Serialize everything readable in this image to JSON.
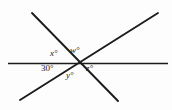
{
  "figure": {
    "kind": "geometry-diagram",
    "background_color": "#fdfdfd",
    "line_color": "#1b1b1b",
    "text_color": "#1b1b1b",
    "width": 172,
    "height": 110
  },
  "lines": [
    {
      "id": "horizontal-line",
      "name": "horizontal-line",
      "x1": 8,
      "y1": 63.5,
      "x2": 168,
      "y2": 63.5,
      "stroke_width": 1.6
    },
    {
      "id": "line-nw-se",
      "name": "line-northwest-southeast",
      "x1": 32,
      "y1": 13,
      "x2": 118,
      "y2": 101,
      "stroke_width": 1.9
    },
    {
      "id": "line-sw-ne",
      "name": "line-southwest-northeast",
      "x1": 20,
      "y1": 100,
      "x2": 158,
      "y2": 13,
      "stroke_width": 1.9
    }
  ],
  "intersection": {
    "x": 75,
    "y": 64
  },
  "labels": [
    {
      "id": "x",
      "text": "x°",
      "x": 50,
      "y": 49,
      "italic": true
    },
    {
      "id": "w",
      "text": "w°",
      "x": 70,
      "y": 46,
      "italic": true
    },
    {
      "id": "a30",
      "text": "30°",
      "x": 41,
      "y": 64,
      "italic": false
    },
    {
      "id": "y",
      "text": "y°",
      "x": 66,
      "y": 71,
      "italic": true
    },
    {
      "id": "z",
      "text": "z°",
      "x": 86,
      "y": 64,
      "italic": true
    }
  ],
  "chart_data": {
    "type": "diagram",
    "title": "",
    "subtitle": "",
    "xlabel": "",
    "ylabel": "",
    "annotations": [
      "x°",
      "w°",
      "30°",
      "y°",
      "z°"
    ],
    "angle_labels": {
      "x": "x°",
      "w": "w°",
      "known": "30°",
      "y": "y°",
      "z": "z°"
    },
    "known_angle_degrees": 30,
    "unknown_angles": [
      "w",
      "x",
      "y",
      "z"
    ],
    "line_count": 3,
    "concurrent": true
  }
}
